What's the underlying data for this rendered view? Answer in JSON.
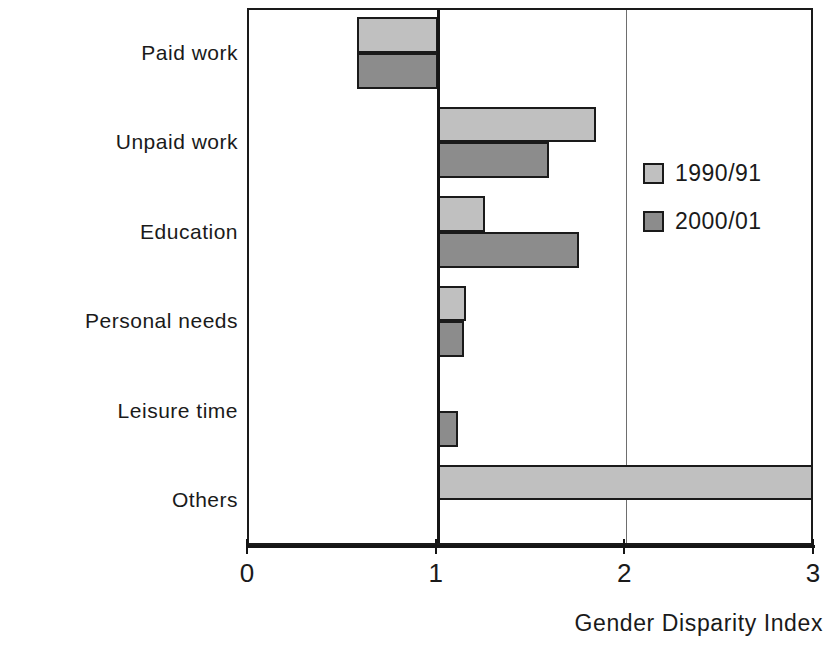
{
  "chart_data": {
    "type": "bar",
    "orientation": "horizontal",
    "title": "",
    "xlabel": "Gender Disparity Index",
    "ylabel": "",
    "xlim": [
      0,
      3
    ],
    "xticks": [
      "0",
      "1",
      "2",
      "3"
    ],
    "grid": true,
    "baseline": 1,
    "legend_position": "right-inside",
    "categories": [
      "Paid work",
      "Unpaid work",
      "Education",
      "Personal needs",
      "Leisure time",
      "Others"
    ],
    "series": [
      {
        "name": "1990/91",
        "color": "#c0c0c0",
        "values": [
          0.57,
          1.84,
          1.25,
          1.15,
          1.0,
          3.0
        ]
      },
      {
        "name": "2000/01",
        "color": "#8c8c8c",
        "values": [
          0.57,
          1.59,
          1.75,
          1.14,
          1.11,
          1.0
        ]
      }
    ]
  },
  "legend": {
    "items": [
      {
        "label": "1990/91",
        "series_class": "s1990"
      },
      {
        "label": "2000/01",
        "series_class": "s2000"
      }
    ]
  },
  "axis": {
    "x_title": "Gender Disparity Index",
    "x_tick_labels": [
      "0",
      "1",
      "2",
      "3"
    ]
  },
  "colors": {
    "series_1990": "#c0c0c0",
    "series_2000": "#8c8c8c",
    "axis": "#151515",
    "grid": "#6e6e6e",
    "background": "#ffffff"
  }
}
